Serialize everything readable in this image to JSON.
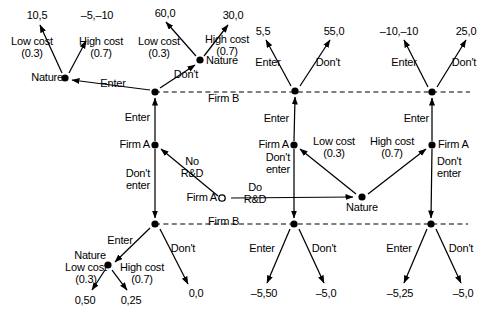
{
  "figure": {
    "type": "game-tree",
    "players": [
      "Firm A",
      "Nature",
      "Firm B"
    ],
    "root_label": "Firm A",
    "information_set_label": "Firm B"
  },
  "labels": {
    "firm_a": "Firm A",
    "nature": "Nature",
    "firm_b": "Firm B",
    "enter": "Enter",
    "dont": "Don't",
    "dont_enter": "Don't\nenter",
    "no_rnd": "No\nR&D",
    "do_rnd": "Do\nR&D",
    "low_cost": "Low cost",
    "high_cost": "High cost",
    "p_low": "(0.3)",
    "p_high": "(0.7)"
  },
  "payoffs": {
    "tl_low": "10,5",
    "tl_high": "–5,–10",
    "tm_low": "60,0",
    "tm_high": "30,0",
    "mid_enter": "5,5",
    "mid_dont": "55,0",
    "right_enter": "–10,–10",
    "right_dont": "25,0",
    "bl_low": "0,50",
    "bl_high": "0,25",
    "bl_dont": "0,0",
    "bm_enter": "–5,50",
    "bm_dont": "–5,0",
    "br_enter": "–5,25",
    "br_dont": "–5,0"
  },
  "nodes": {
    "root_firm_a": {
      "x": 222,
      "y": 198,
      "kind": "open",
      "owner": "Firm A"
    },
    "nature_rnd": {
      "x": 362,
      "y": 197,
      "kind": "filled",
      "owner": "Nature"
    },
    "firm_a_left": {
      "x": 155,
      "y": 145,
      "kind": "filled",
      "owner": "Firm A"
    },
    "firm_a_mid": {
      "x": 294,
      "y": 145,
      "kind": "filled",
      "owner": "Firm A"
    },
    "firm_a_right": {
      "x": 432,
      "y": 145,
      "kind": "filled",
      "owner": "Firm A"
    },
    "firm_b_top_left": {
      "x": 155,
      "y": 92,
      "kind": "filled",
      "owner": "Firm B"
    },
    "firm_b_top_mid": {
      "x": 295,
      "y": 91,
      "kind": "filled",
      "owner": "Firm B"
    },
    "firm_b_top_right": {
      "x": 432,
      "y": 92,
      "kind": "filled",
      "owner": "Firm B"
    },
    "firm_b_bot_left": {
      "x": 155,
      "y": 224,
      "kind": "filled",
      "owner": "Firm B"
    },
    "firm_b_bot_mid": {
      "x": 294,
      "y": 224,
      "kind": "filled",
      "owner": "Firm B"
    },
    "firm_b_bot_right": {
      "x": 431,
      "y": 224,
      "kind": "filled",
      "owner": "Firm B"
    },
    "nature_top_left": {
      "x": 65,
      "y": 78,
      "kind": "filled",
      "owner": "Nature"
    },
    "nature_top_mid": {
      "x": 200,
      "y": 60,
      "kind": "filled",
      "owner": "Nature"
    },
    "nature_bot_left": {
      "x": 108,
      "y": 265,
      "kind": "filled",
      "owner": "Nature"
    }
  },
  "info_sets": [
    {
      "name": "firm-b-top-info-set",
      "x1": 155,
      "y1": 92,
      "x2": 470,
      "y2": 92
    },
    {
      "name": "firm-b-bottom-info-set",
      "x1": 155,
      "y1": 224,
      "x2": 468,
      "y2": 224
    }
  ]
}
